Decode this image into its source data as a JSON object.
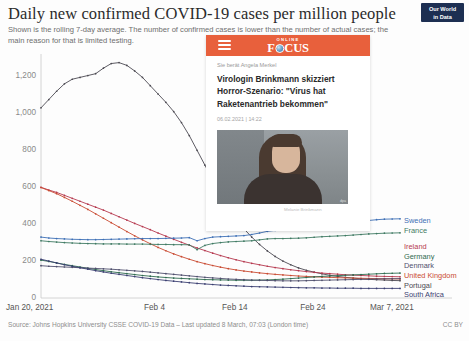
{
  "header": {
    "title": "Daily new confirmed COVID-19 cases per million people",
    "subtitle": "Shown is the rolling 7-day average. The number of confirmed cases is lower than the number of actual cases; the main reason for that is limited testing.",
    "logo_line1": "Our World",
    "logo_line2": "in Data"
  },
  "footer": {
    "source": "Source: Johns Hopkins University CSSE COVID-19 Data – Last updated 8 March, 07:03 (London time)",
    "license": "CC BY"
  },
  "news_card": {
    "brand_online": "ONLINE",
    "brand_word_a": "F",
    "brand_word_b": "CUS",
    "kicker": "Sie berät Angela Merkel",
    "headline": "Virologin Brinkmann skizziert Horror-Szenario: \"Virus hat Raketenantrieb bekommen\"",
    "headline_line1": "Virologin Brinkmann skizziert",
    "headline_line2": "Horror-Szenario: \"Virus hat",
    "headline_line3": "Raketenantrieb bekommen\"",
    "date": "06.02.2021  |  14:22",
    "photo_credit": "dpa",
    "photo_caption": "Melanie Brinkmann"
  },
  "chart_data": {
    "type": "line",
    "title": "Daily new confirmed COVID-19 cases per million people",
    "subtitle": "Shown is the rolling 7-day average. The number of confirmed cases is lower than the number of actual cases; the main reason for that is limited testing.",
    "xlabel": "",
    "ylabel": "",
    "ylim": [
      0,
      1300
    ],
    "yticks": [
      0,
      200,
      400,
      600,
      800,
      1000,
      1200
    ],
    "ytick_labels": [
      "0",
      "200",
      "400",
      "600",
      "800",
      "1,000",
      "1,200"
    ],
    "xlim": [
      "Jan 20, 2021",
      "Mar 7, 2021"
    ],
    "xticks": [
      "Jan 20, 2021",
      "Feb 4",
      "Feb 14",
      "Feb 24",
      "Mar 7, 2021"
    ],
    "xtick_positions_days": [
      0,
      15,
      25,
      35,
      46
    ],
    "grid": false,
    "legend_position": "right",
    "x_days": [
      0,
      1,
      2,
      3,
      4,
      5,
      6,
      7,
      8,
      9,
      10,
      11,
      12,
      13,
      14,
      15,
      16,
      17,
      18,
      19,
      20,
      21,
      22,
      23,
      24,
      25,
      26,
      27,
      28,
      29,
      30,
      31,
      32,
      33,
      34,
      35,
      36,
      37,
      38,
      39,
      40,
      41,
      42,
      43,
      44,
      45,
      46
    ],
    "series": [
      {
        "name": "Portugal",
        "color": "#4c4a52",
        "values": [
          1030,
          1075,
          1120,
          1160,
          1185,
          1195,
          1205,
          1215,
          1245,
          1270,
          1275,
          1260,
          1230,
          1195,
          1150,
          1105,
          1060,
          1010,
          950,
          880,
          800,
          720,
          640,
          565,
          495,
          430,
          375,
          330,
          290,
          255,
          225,
          200,
          180,
          163,
          150,
          140,
          131,
          123,
          117,
          112,
          108,
          104,
          101,
          99,
          97,
          95,
          94
        ]
      },
      {
        "name": "Ireland",
        "color": "#b6394f",
        "values": [
          600,
          585,
          572,
          556,
          540,
          524,
          508,
          492,
          476,
          458,
          440,
          422,
          404,
          387,
          370,
          352,
          335,
          318,
          302,
          286,
          271,
          257,
          243,
          230,
          218,
          207,
          197,
          188,
          180,
          172,
          165,
          159,
          153,
          148,
          143,
          139,
          135,
          132,
          129,
          126,
          124,
          122,
          120,
          118,
          117,
          116,
          115
        ]
      },
      {
        "name": "United Kingdom",
        "color": "#c94b32",
        "values": [
          598,
          582,
          565,
          545,
          524,
          502,
          480,
          456,
          432,
          408,
          384,
          360,
          337,
          315,
          294,
          274,
          256,
          239,
          224,
          210,
          197,
          186,
          176,
          167,
          159,
          152,
          146,
          141,
          136,
          132,
          128,
          125,
          122,
          119,
          117,
          115,
          113,
          112,
          110,
          109,
          108,
          107,
          106,
          105,
          104,
          104,
          103
        ]
      },
      {
        "name": "Sweden",
        "color": "#3d6fb5",
        "values": [
          330,
          325,
          322,
          320,
          318,
          317,
          316,
          316,
          317,
          318,
          319,
          320,
          321,
          322,
          322,
          322,
          323,
          324,
          325,
          327,
          310,
          322,
          330,
          332,
          334,
          336,
          338,
          344,
          352,
          361,
          366,
          368,
          370,
          373,
          378,
          384,
          390,
          394,
          398,
          402,
          408,
          414,
          420,
          424,
          427,
          428,
          429
        ]
      },
      {
        "name": "France",
        "color": "#3f7a63"
      },
      {
        "name": "Germany",
        "color": "#2f6b4f",
        "values": [
          205,
          198,
          190,
          182,
          175,
          168,
          161,
          154,
          148,
          142,
          137,
          132,
          127,
          122,
          118,
          114,
          111,
          108,
          106,
          104,
          102,
          100,
          99,
          98,
          97,
          96,
          96,
          96,
          97,
          98,
          100,
          102,
          105,
          108,
          111,
          114,
          117,
          119,
          121,
          123,
          125,
          127,
          129,
          131,
          133,
          134,
          135
        ]
      },
      {
        "name": "Denmark",
        "color": "#4f4f6d",
        "values": [
          175,
          172,
          170,
          168,
          166,
          164,
          162,
          160,
          158,
          156,
          153,
          150,
          147,
          144,
          140,
          136,
          132,
          128,
          124,
          120,
          116,
          112,
          109,
          106,
          103,
          101,
          99,
          97,
          96,
          95,
          94,
          93,
          93,
          93,
          94,
          95,
          96,
          97,
          98,
          99,
          100,
          101,
          102,
          103,
          104,
          104,
          105
        ]
      },
      {
        "name": "South Africa",
        "color": "#3b3f72",
        "values": [
          210,
          200,
          190,
          180,
          172,
          164,
          156,
          148,
          141,
          134,
          128,
          122,
          116,
          110,
          105,
          100,
          95,
          91,
          87,
          83,
          79,
          76,
          73,
          70,
          68,
          66,
          64,
          62,
          61,
          60,
          59,
          58,
          57,
          56,
          55,
          55,
          54,
          54,
          53,
          53,
          53,
          52,
          52,
          52,
          52,
          52,
          52
        ]
      }
    ],
    "france_values": [
      310,
      306,
      303,
      300,
      298,
      296,
      295,
      294,
      293,
      293,
      293,
      292,
      292,
      292,
      291,
      290,
      290,
      289,
      289,
      288,
      262,
      285,
      295,
      300,
      304,
      306,
      308,
      310,
      315,
      320,
      322,
      322,
      323,
      324,
      326,
      329,
      332,
      334,
      336,
      338,
      341,
      344,
      347,
      349,
      351,
      352,
      353
    ],
    "legend": [
      {
        "label": "Sweden",
        "color": "#3d6fb5"
      },
      {
        "label": "France",
        "color": "#3f7a63"
      },
      {
        "label": "Ireland",
        "color": "#b6394f"
      },
      {
        "label": "Germany",
        "color": "#2f6b4f"
      },
      {
        "label": "Denmark",
        "color": "#4f4f6d"
      },
      {
        "label": "United Kingdom",
        "color": "#c94b32"
      },
      {
        "label": "Portugal",
        "color": "#4c4a52"
      },
      {
        "label": "South Africa",
        "color": "#3b3f72"
      }
    ]
  }
}
